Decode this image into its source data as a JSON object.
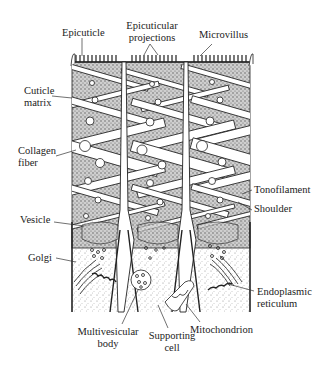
{
  "figure": {
    "type": "labeled anatomical illustration",
    "colors": {
      "ink": "#222222",
      "background": "#ffffff",
      "stipple": "#888888"
    }
  },
  "labels": {
    "epicuticle": "Epicuticle",
    "epicuticular_projections_1": "Epicuticular",
    "epicuticular_projections_2": "projections",
    "microvillus": "Microvillus",
    "cuticle_matrix_1": "Cuticle",
    "cuticle_matrix_2": "matrix",
    "collagen_fiber_1": "Collagen",
    "collagen_fiber_2": "fiber",
    "tonofilament": "Tonofilament",
    "shoulder": "Shoulder",
    "vesicle": "Vesicle",
    "golgi": "Golgi",
    "endoplasmic_reticulum_1": "Endoplasmic",
    "endoplasmic_reticulum_2": "reticulum",
    "multivesicular_body_1": "Multivesicular",
    "multivesicular_body_2": "body",
    "supporting_cell_1": "Supporting",
    "supporting_cell_2": "cell",
    "mitochondrion": "Mitochondrion"
  }
}
